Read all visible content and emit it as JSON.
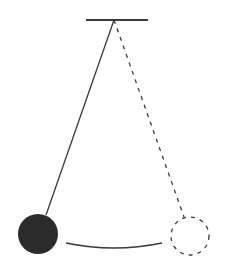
{
  "diagram": {
    "type": "pendulum",
    "colors": {
      "line": "#3a3a3a",
      "bob_fill": "#2b2b2b",
      "background": "#ffffff"
    },
    "support": {
      "x1": 86,
      "x2": 148,
      "y": 20
    },
    "pivot": {
      "x": 114,
      "y": 20
    },
    "bob_left": {
      "cx": 38,
      "cy": 234,
      "r": 20,
      "style": "filled"
    },
    "bob_right": {
      "cx": 190,
      "cy": 236,
      "r": 19,
      "style": "dashed-outline"
    },
    "swing_arc": {
      "start": [
        66,
        243
      ],
      "control": [
        114,
        253
      ],
      "end": [
        162,
        243
      ]
    }
  }
}
